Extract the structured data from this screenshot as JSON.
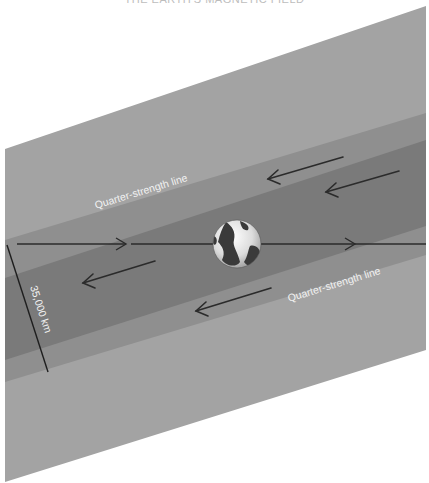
{
  "diagram": {
    "title": "THE EARTH'S MAGNETIC FIELD",
    "labels": {
      "upper_line": "Quarter-strength line",
      "lower_line": "Quarter-strength line",
      "measurement": "35,000 km"
    },
    "colors": {
      "background": "#ffffff",
      "outer_band": "#a3a3a3",
      "quarter_band": "#8f8f8f",
      "core_band": "#7a7a7a",
      "arrow": "#2b2b2b",
      "label_text": "#f2f2f2"
    },
    "elements": {
      "globe": "earth-globe",
      "axis_arrows": [
        "right",
        "right"
      ],
      "flow_arrows": [
        "left",
        "left",
        "left",
        "left"
      ]
    }
  }
}
